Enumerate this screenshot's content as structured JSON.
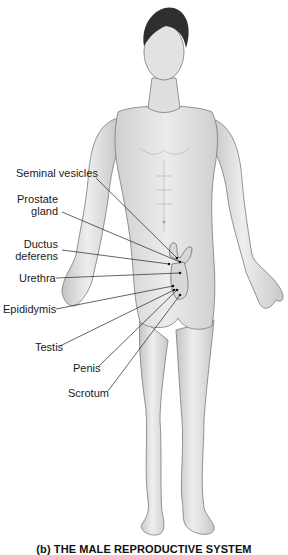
{
  "figure": {
    "caption": "(b) THE MALE REPRODUCTIVE SYSTEM",
    "colors": {
      "background": "#ffffff",
      "skin": "#e4e4e4",
      "skin_shadow": "#bdbdbd",
      "outline": "#7a7a7a",
      "hair": "#2f2f2f",
      "leader_line": "#222222",
      "organ_outline": "#6e6e6e"
    }
  },
  "labels": [
    {
      "id": "seminal-vesicles",
      "lines": [
        "Seminal vesicles"
      ],
      "x": 16,
      "y": 167,
      "target": [
        177,
        258
      ]
    },
    {
      "id": "prostate-gland",
      "lines": [
        "Prostate",
        "gland"
      ],
      "x": 14,
      "y": 193,
      "target": [
        180,
        262
      ]
    },
    {
      "id": "ductus-deferens",
      "lines": [
        "Ductus",
        "deferens"
      ],
      "x": 22,
      "y": 238,
      "target": [
        169,
        264
      ]
    },
    {
      "id": "urethra",
      "lines": [
        "Urethra"
      ],
      "x": 19,
      "y": 272,
      "target": [
        180,
        273
      ]
    },
    {
      "id": "epididymis",
      "lines": [
        "Epididymis"
      ],
      "x": 3,
      "y": 303,
      "target": [
        173,
        286
      ]
    },
    {
      "id": "testis",
      "lines": [
        "Testis"
      ],
      "x": 35,
      "y": 341,
      "target": [
        174,
        290
      ]
    },
    {
      "id": "penis",
      "lines": [
        "Penis"
      ],
      "x": 73,
      "y": 362,
      "target": [
        177,
        290
      ]
    },
    {
      "id": "scrotum",
      "lines": [
        "Scrotum"
      ],
      "x": 68,
      "y": 387,
      "target": [
        180,
        295
      ]
    }
  ]
}
